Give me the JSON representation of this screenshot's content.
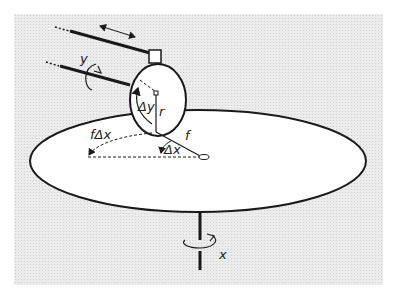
{
  "diagram": {
    "labels": {
      "y": "y",
      "delta_y": "Δy",
      "r": "r",
      "f_delta_x": "fΔx",
      "f": "f",
      "delta_x": "Δx",
      "x": "x"
    },
    "colors": {
      "background_panel": "#e6e6e6",
      "disc": "#ffffff",
      "stroke": "#1a1a1a"
    }
  }
}
